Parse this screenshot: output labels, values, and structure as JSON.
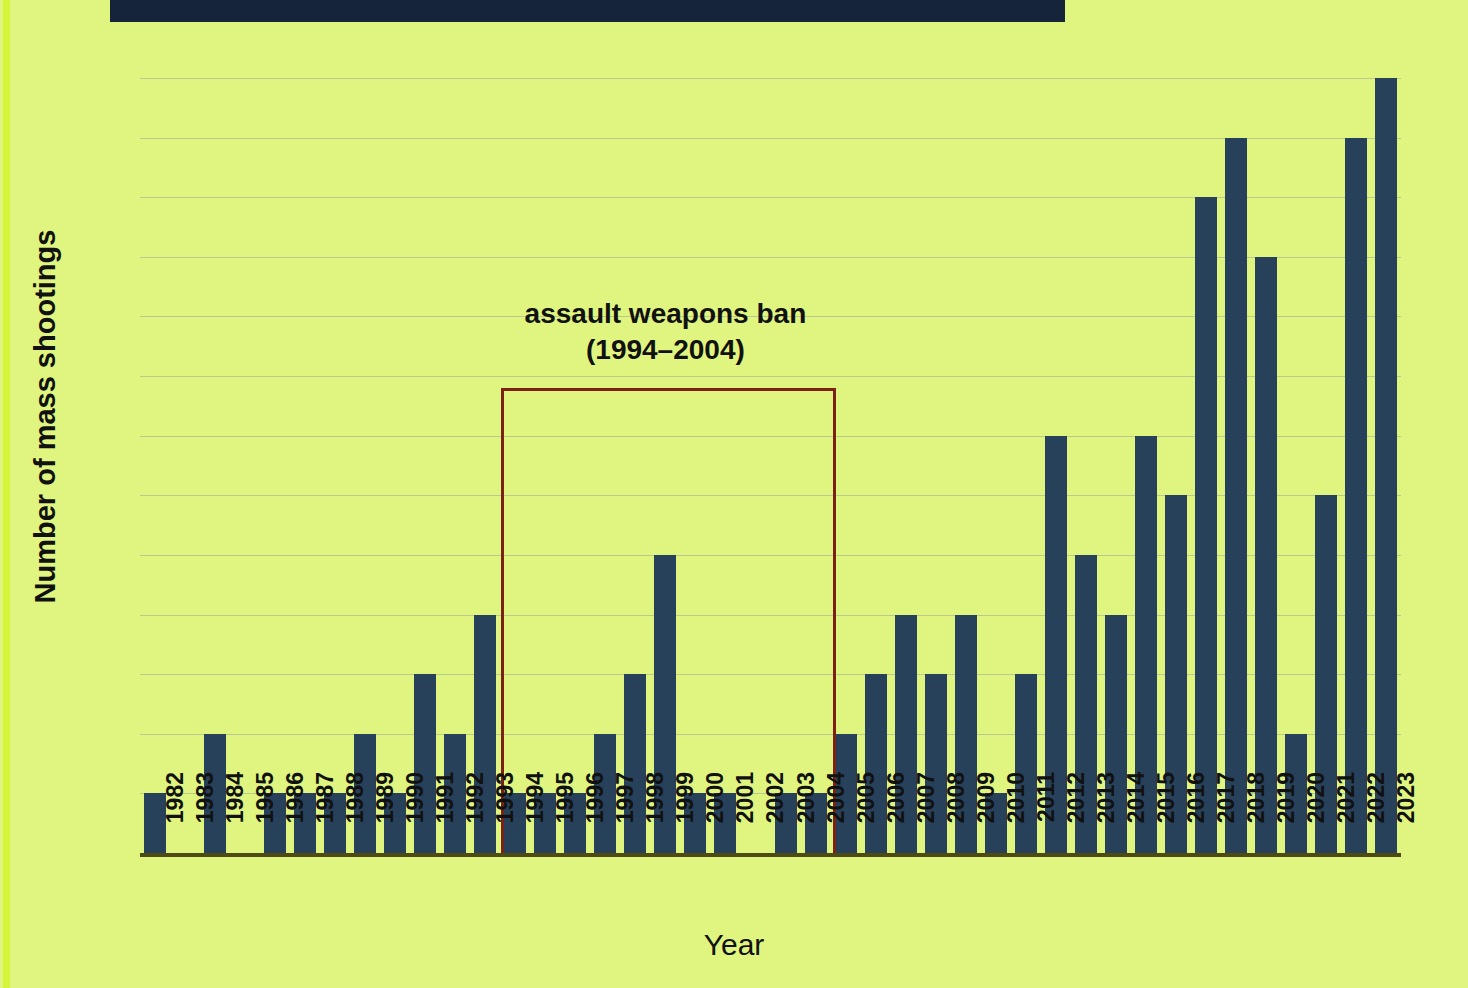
{
  "page": {
    "background_color": "#dff57f",
    "accent_stripe_color": "#d4f53a",
    "header_bar_color": "#16243a"
  },
  "chart_data": {
    "type": "bar",
    "title": "",
    "xlabel": "Year",
    "ylabel": "Number of mass shootings",
    "ylim": [
      0,
      13
    ],
    "ytick_labels": [
      "0",
      "1",
      "2",
      "3",
      "4",
      "5",
      "6",
      "7",
      "8",
      "9",
      "10",
      "11",
      "12",
      "13"
    ],
    "grid": true,
    "legend": "none",
    "bar_color": "#27415a",
    "categories": [
      "1982",
      "1983",
      "1984",
      "1985",
      "1986",
      "1987",
      "1988",
      "1989",
      "1990",
      "1991",
      "1992",
      "1993",
      "1994",
      "1995",
      "1996",
      "1997",
      "1998",
      "1999",
      "2000",
      "2001",
      "2002",
      "2003",
      "2004",
      "2005",
      "2006",
      "2007",
      "2008",
      "2009",
      "2010",
      "2011",
      "2012",
      "2013",
      "2014",
      "2015",
      "2016",
      "2017",
      "2018",
      "2019",
      "2020",
      "2021",
      "2022",
      "2023"
    ],
    "values": [
      1,
      0,
      2,
      0,
      1,
      1,
      1,
      2,
      1,
      3,
      2,
      4,
      1,
      1,
      1,
      2,
      3,
      5,
      1,
      1,
      0,
      1,
      1,
      2,
      3,
      4,
      3,
      4,
      1,
      3,
      7,
      5,
      4,
      7,
      6,
      11,
      12,
      10,
      2,
      6,
      12,
      13
    ],
    "annotations": [
      {
        "name": "assault-weapons-ban",
        "label": "assault weapons ban\n(1994–2004)",
        "x_start": "1994",
        "x_end": "2004",
        "y_top": 7.8,
        "color": "#7c2118"
      }
    ]
  }
}
